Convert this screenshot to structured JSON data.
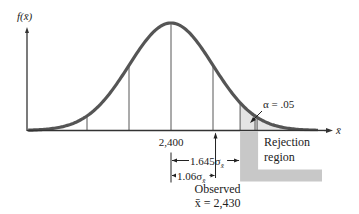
{
  "chart_data": {
    "type": "area",
    "title": "",
    "distribution": "normal",
    "ylabel": "f(x̄)",
    "xlabel": "x̄",
    "mean": 2400,
    "mean_label": "2,400",
    "sigma_gridlines": [
      -2,
      -1,
      0,
      1,
      2
    ],
    "critical_z": 1.645,
    "observed_z": 1.06,
    "observed_value": 2430,
    "alpha": 0.05,
    "annotations": {
      "alpha_label": "α = .05",
      "rejection_label_line1": "Rejection",
      "rejection_label_line2": "region",
      "critical_distance_label": "1.645σ",
      "critical_distance_sub": "x̄",
      "observed_distance_label": "1.06σ",
      "observed_distance_sub": "x̄",
      "observed_label_line1": "Observed",
      "observed_label_line2": "x̄ = 2,430"
    },
    "colors": {
      "curve": "#555555",
      "tail_fill": "#e4e4e4",
      "rejection_box": "#c8c8c8",
      "axis": "#333333"
    },
    "z_range": [
      -3.4,
      3.5
    ]
  }
}
